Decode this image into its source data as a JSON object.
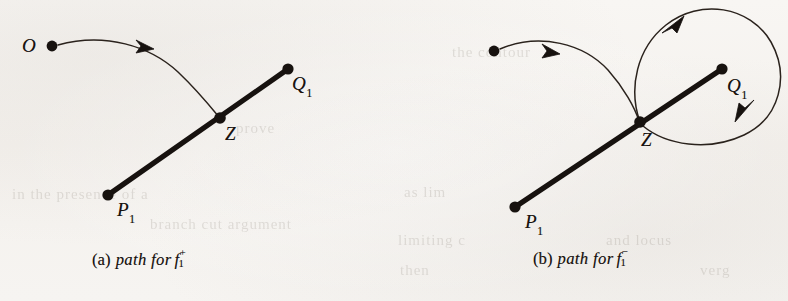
{
  "figure": {
    "background_color": "#f7f5f2",
    "ink_color": "#17120f",
    "panels": [
      {
        "id": "a",
        "caption_tag": "(a)",
        "caption_text": "path for",
        "caption_symbol": "f",
        "caption_superscript": "+",
        "caption_subscript": "1",
        "points": [
          {
            "name": "O",
            "label": "O",
            "sub": "",
            "x": 52,
            "y": 46
          },
          {
            "name": "Q1",
            "label": "Q",
            "sub": "1",
            "x": 288,
            "y": 69
          },
          {
            "name": "Z",
            "label": "Z",
            "sub": "",
            "x": 220,
            "y": 118
          },
          {
            "name": "P1",
            "label": "P",
            "sub": "1",
            "x": 108,
            "y": 195
          }
        ],
        "segment": {
          "from": "P1",
          "to": "Q1",
          "through": "Z"
        },
        "arrows": [
          {
            "name": "path-arrow",
            "x": 146,
            "y": 47
          }
        ],
        "description": "A thin curve runs from O, arcs right and down, ending at Z on the thick segment P1-Q1."
      },
      {
        "id": "b",
        "caption_tag": "(b)",
        "caption_text": "path for",
        "caption_symbol": "f",
        "caption_superscript": "−",
        "caption_subscript": "1",
        "points": [
          {
            "name": "O",
            "label": "",
            "sub": "",
            "x": 100,
            "y": 51
          },
          {
            "name": "Q1",
            "label": "Q",
            "sub": "1",
            "x": 328,
            "y": 69
          },
          {
            "name": "Z",
            "label": "Z",
            "sub": "",
            "x": 246,
            "y": 122
          },
          {
            "name": "P1",
            "label": "P",
            "sub": "1",
            "x": 121,
            "y": 207
          }
        ],
        "segment": {
          "from": "P1",
          "to": "Q1",
          "through": "Z"
        },
        "arrows": [
          {
            "name": "path-arrow",
            "x": 158,
            "y": 52
          },
          {
            "name": "loop-arrow-up",
            "x": 281,
            "y": 22
          },
          {
            "name": "loop-arrow-down",
            "x": 348,
            "y": 116
          }
        ],
        "description": "A thin curve runs from the start dot to Z, then a large loop encircles Q1 counterclockwise and returns to Z."
      }
    ],
    "ghost_text": [
      {
        "text": "in the presence of a",
        "x": 12,
        "y": 186
      },
      {
        "text": "branch cut argument",
        "x": 150,
        "y": 216
      },
      {
        "text": "as lim",
        "x": 404,
        "y": 184
      },
      {
        "text": "limiting c",
        "x": 398,
        "y": 232
      },
      {
        "text": "and locus",
        "x": 606,
        "y": 232
      },
      {
        "text": "then",
        "x": 400,
        "y": 262
      },
      {
        "text": "verg",
        "x": 700,
        "y": 262
      },
      {
        "text": "prove",
        "x": 236,
        "y": 120
      },
      {
        "text": "the contour",
        "x": 452,
        "y": 44
      }
    ]
  }
}
